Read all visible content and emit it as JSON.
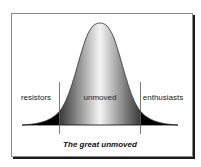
{
  "diagram": {
    "title": "The great unmoved",
    "type": "bell-curve",
    "segments": [
      {
        "label": "resistors",
        "position": "left-tail",
        "fill": "#000000"
      },
      {
        "label": "unmoved",
        "position": "center",
        "fill": "gradient-gray-white"
      },
      {
        "label": "enthusiasts",
        "position": "right-tail",
        "fill": "#000000"
      }
    ]
  },
  "colors": {
    "frame_border": "#8a8a8a",
    "shadow": "#1a1a1a",
    "tail_fill": "#000000",
    "outline": "#333333"
  }
}
